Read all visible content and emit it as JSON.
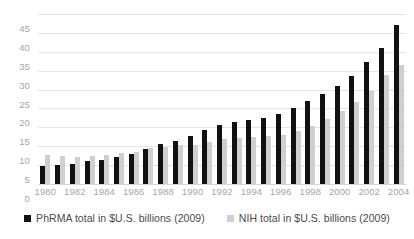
{
  "chart_data": {
    "type": "bar",
    "title": "",
    "subtitle": "",
    "xlabel": "",
    "ylabel": "",
    "ylim": [
      0,
      45
    ],
    "ytick_step": 5,
    "yticks": [
      "45",
      "40",
      "35",
      "30",
      "25",
      "20",
      "15",
      "10",
      "5",
      "0"
    ],
    "grid": true,
    "legend_position": "bottom",
    "categories": [
      "1980",
      "1981",
      "1982",
      "1983",
      "1984",
      "1985",
      "1986",
      "1987",
      "1988",
      "1989",
      "1990",
      "1991",
      "1992",
      "1993",
      "1994",
      "1995",
      "1996",
      "1997",
      "1998",
      "1999",
      "2000",
      "2001",
      "2002",
      "2003",
      "2004"
    ],
    "xtick_labels": [
      "1980",
      "",
      "1982",
      "",
      "1984",
      "",
      "1986",
      "",
      "1988",
      "",
      "1990",
      "",
      "1992",
      "",
      "1994",
      "",
      "1996",
      "",
      "1998",
      "",
      "2000",
      "",
      "2002",
      "",
      "2004"
    ],
    "series": [
      {
        "name": "PhRMA total in $U.S. billions (2009)",
        "color": "#111111",
        "values": [
          4.7,
          5.0,
          5.4,
          6.1,
          6.4,
          7.1,
          8.0,
          9.3,
          10.5,
          11.4,
          12.6,
          14.2,
          15.6,
          16.4,
          17.0,
          17.6,
          18.6,
          20.2,
          22.1,
          23.9,
          26.0,
          28.6,
          32.3,
          36.0,
          42.0
        ]
      },
      {
        "name": "NIH total in $U.S. billions (2009)",
        "color": "#cfcfcf",
        "values": [
          7.6,
          7.5,
          7.1,
          7.4,
          7.8,
          8.3,
          8.5,
          9.5,
          9.8,
          10.2,
          10.4,
          11.2,
          11.8,
          12.2,
          12.5,
          12.7,
          13.0,
          14.1,
          15.3,
          17.1,
          19.2,
          21.6,
          24.5,
          28.8,
          31.5
        ]
      }
    ]
  },
  "legend": {
    "items": [
      {
        "label": "PhRMA total in $U.S. billions (2009)",
        "swatch": "phrma"
      },
      {
        "label": "NIH total in $U.S. billions (2009)",
        "swatch": "nih"
      }
    ]
  }
}
